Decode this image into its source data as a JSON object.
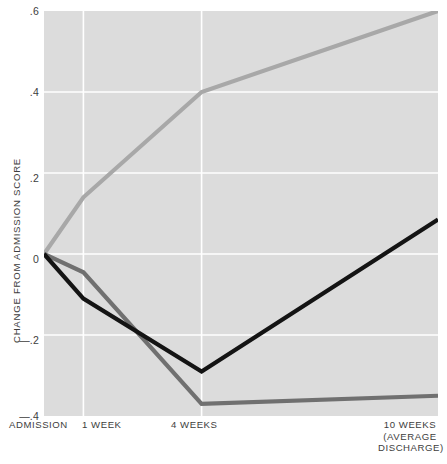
{
  "chart_data": {
    "type": "line",
    "title": "",
    "subtitle": "",
    "xlabel": "",
    "ylabel": "CHANGE FROM ADMISSION SCORE",
    "categories": [
      "ADMISSION",
      "1 WEEK",
      "4 WEEKS",
      "10 WEEKS\n(AVERAGE\nDISCHARGE)"
    ],
    "x": [
      0,
      1,
      4,
      10
    ],
    "xlim": [
      0,
      10
    ],
    "ylim": [
      -0.4,
      0.6
    ],
    "yticks": [
      0.6,
      0.4,
      0.2,
      0,
      -0.2,
      -0.4
    ],
    "ytick_labels": [
      ".6",
      ".4",
      ".2",
      "0",
      "—.2",
      "—.4"
    ],
    "grid": true,
    "legend": "none",
    "series": [
      {
        "name": "light-gray-line",
        "color": "#a8a8a8",
        "values": [
          0,
          0.14,
          0.4,
          0.6
        ]
      },
      {
        "name": "black-line",
        "color": "#141414",
        "values": [
          0,
          -0.11,
          -0.29,
          0.085
        ]
      },
      {
        "name": "medium-gray-line",
        "color": "#707070",
        "values": [
          0,
          -0.045,
          -0.37,
          -0.35
        ]
      }
    ],
    "colors": {
      "panel_background": "#dcdcdc",
      "page_background": "#ffffff",
      "gridline": "#ffffff",
      "text": "#3d3d3d"
    }
  },
  "axes": {
    "y_ticks": [
      {
        "label": ".6",
        "top": 6
      },
      {
        "label": ".4",
        "top": 87
      },
      {
        "label": ".2",
        "top": 173
      },
      {
        "label": "0",
        "top": 254
      },
      {
        "label": "—.2",
        "top": 335
      },
      {
        "label": "—.4",
        "top": 411
      }
    ],
    "y_title": "CHANGE FROM ADMISSION SCORE",
    "x_ticks": [
      {
        "label": "ADMISSION",
        "key": "admission"
      },
      {
        "label": "1 WEEK",
        "key": "1week"
      },
      {
        "label": "4 WEEKS",
        "key": "4weeks"
      },
      {
        "label": "10 WEEKS\n(AVERAGE\nDISCHARGE)",
        "key": "10weeks"
      }
    ]
  }
}
